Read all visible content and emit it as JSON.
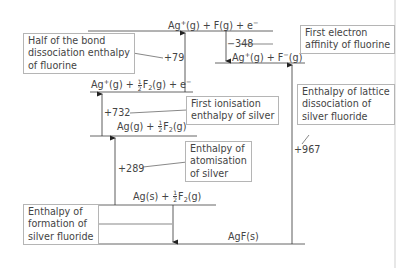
{
  "diagram": {
    "type": "Born-Haber cycle",
    "compound": "silver fluoride",
    "border_color": "#c8c8c8",
    "line_color": "#555555",
    "levels": [
      {
        "id": "top",
        "species": "Ag",
        "charge": "+",
        "state": "(g) + F(g) + e",
        "electron_sup": "−"
      },
      {
        "id": "after_ea",
        "species": "Ag",
        "charge": "+",
        "mid": "(g) + F",
        "charge2": "−",
        "state": "(g)"
      },
      {
        "id": "ionised",
        "prefix": "Ag",
        "charge": "+",
        "mid": "(g) + ",
        "frac_num": "1",
        "frac_den": "2",
        "f2": "F",
        "sub": "2",
        "suffix": "(g) + e",
        "electron_sup": "−"
      },
      {
        "id": "atomised",
        "prefix": "Ag(g) + ",
        "frac_num": "1",
        "frac_den": "2",
        "f2": "F",
        "sub": "2",
        "suffix": "(g)"
      },
      {
        "id": "elements",
        "prefix": "Ag(s) + ",
        "frac_num": "1",
        "frac_den": "2",
        "f2": "F",
        "sub": "2",
        "suffix": "(g)"
      },
      {
        "id": "compound",
        "label": "AgF(s)"
      }
    ],
    "values": {
      "bond_dissociation": "+79",
      "electron_affinity": "−348",
      "ionisation": "+732",
      "atomisation": "+289",
      "lattice_dissociation": "+967"
    },
    "boxes": {
      "bond_dissociation": [
        "Half of the bond",
        "dissociation enthalpy",
        "of fluorine"
      ],
      "electron_affinity": [
        "First electron",
        "affinity of fluorine"
      ],
      "ionisation": [
        "First ionisation",
        "enthalpy of silver"
      ],
      "atomisation": [
        "Enthalpy of",
        "atomisation",
        "of silver"
      ],
      "lattice": [
        "Enthalpy of lattice",
        "dissociation of",
        "silver fluoride"
      ],
      "formation": [
        "Enthalpy of",
        "formation of",
        "silver fluoride"
      ]
    }
  }
}
